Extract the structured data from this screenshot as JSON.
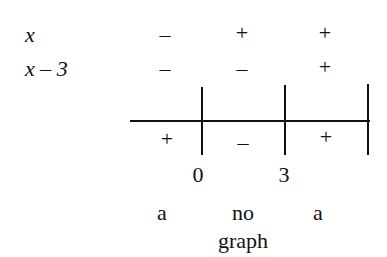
{
  "rows": [
    {
      "label": "x",
      "signs": [
        "–",
        "+",
        "+"
      ]
    },
    {
      "label": "x – 3",
      "signs": [
        "–",
        "–",
        "+"
      ]
    }
  ],
  "result_signs": [
    "+",
    "–",
    "+"
  ],
  "critical_points": [
    "0",
    "3"
  ],
  "interval_notes": [
    "a",
    "no",
    "a"
  ],
  "interval_notes_line2": [
    "",
    "graph",
    ""
  ]
}
